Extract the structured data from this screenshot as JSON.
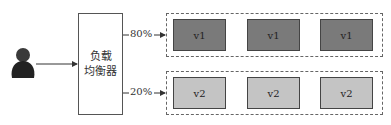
{
  "load_balancer": {
    "line1": "负载",
    "line2": "均衡器"
  },
  "routes": [
    {
      "percent": "80%",
      "version": "v1",
      "fill": "#7a7a7a",
      "instances": [
        "v1",
        "v1",
        "v1"
      ]
    },
    {
      "percent": "20%",
      "version": "v2",
      "fill": "#c4c4c4",
      "instances": [
        "v2",
        "v2",
        "v2"
      ]
    }
  ],
  "user": {
    "icon": "user-icon",
    "color": "#2a2a2a"
  }
}
